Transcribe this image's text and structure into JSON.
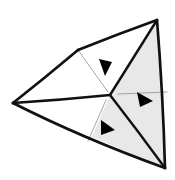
{
  "figure": {
    "canvas": {
      "width": 175,
      "height": 180
    },
    "colors": {
      "background": "#ffffff",
      "stroke": "#111111",
      "shade_fill": "#e8e8e8",
      "white_fill": "#ffffff",
      "thin_line": "#9a9a9a",
      "arrow_fill": "#000000"
    },
    "stroke_widths": {
      "outline": 2.6,
      "inner": 2.2,
      "thin": 0.9
    },
    "vertices": {
      "top_apex": {
        "x": 78,
        "y": 50,
        "label": "A"
      },
      "top_right": {
        "x": 157,
        "y": 20,
        "label": "B"
      },
      "left": {
        "x": 13,
        "y": 103,
        "label": "C"
      },
      "bottom_right": {
        "x": 165,
        "y": 168,
        "label": "D"
      },
      "center": {
        "x": 110,
        "y": 95,
        "label": "O"
      },
      "bottom_mid": {
        "x": 90,
        "y": 141,
        "label": "E"
      }
    },
    "facets": [
      {
        "name": "upper-left-facet",
        "fill": "white",
        "points": "78,50 157,20 110,95 13,103"
      },
      {
        "name": "right-shaded-facet",
        "fill": "shaded",
        "points": "157,20 165,168 110,95"
      },
      {
        "name": "lower-left-shaded-facet",
        "fill": "shaded",
        "points": "13,103 110,95 165,168"
      },
      {
        "name": "center-white-wedge",
        "fill": "white",
        "points": "110,95 90,141 13,103"
      }
    ],
    "heavy_edges": [
      {
        "name": "edge-left-to-apex",
        "from": [
          13,
          103
        ],
        "to": [
          78,
          50
        ]
      },
      {
        "name": "edge-apex-to-topright",
        "from": [
          78,
          50
        ],
        "to": [
          157,
          20
        ]
      },
      {
        "name": "edge-topright-to-center",
        "from": [
          157,
          20
        ],
        "to": [
          110,
          95
        ]
      },
      {
        "name": "edge-topright-to-bottomright",
        "from": [
          157,
          20
        ],
        "to": [
          165,
          168
        ]
      },
      {
        "name": "edge-center-to-bottomright",
        "from": [
          110,
          95
        ],
        "to": [
          165,
          168
        ]
      },
      {
        "name": "edge-left-to-center",
        "from": [
          13,
          103
        ],
        "to": [
          110,
          95
        ]
      },
      {
        "name": "edge-left-to-bottomright",
        "from": [
          13,
          103
        ],
        "to": [
          165,
          168
        ]
      }
    ],
    "thin_lines": [
      {
        "name": "crease-apex-to-center",
        "from": [
          78,
          50
        ],
        "to": [
          108,
          92
        ]
      },
      {
        "name": "crease-center-to-lower-left",
        "from": [
          106,
          100
        ],
        "to": [
          88,
          141
        ]
      },
      {
        "name": "crease-center-to-right",
        "from": [
          118,
          94
        ],
        "to": [
          167,
          92
        ]
      }
    ],
    "arrows": [
      {
        "name": "fold-arrow-top",
        "points": "99,59 112,62 105,76",
        "direction": "down-right"
      },
      {
        "name": "fold-arrow-right",
        "points": "137,92 153,101 140,107",
        "direction": "down-left"
      },
      {
        "name": "fold-arrow-bottom",
        "points": "101,120 115,130 101,135",
        "direction": "right"
      }
    ]
  }
}
